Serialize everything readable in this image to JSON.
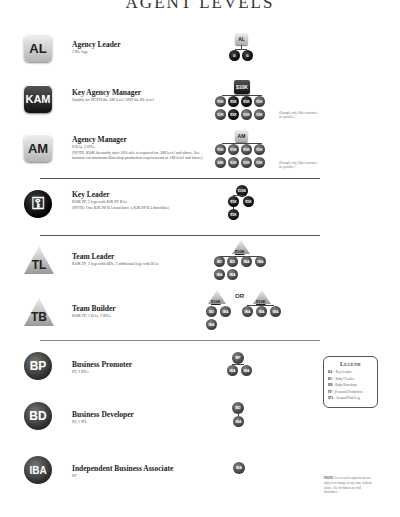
{
  "page_title": "AGENT LEVELS",
  "levels": [
    {
      "badge": "AL",
      "title": "Agency Leader",
      "desc": "2 KL legs"
    },
    {
      "badge": "KAM",
      "title": "Key Agency Manager",
      "desc": "Qualify for BOTH the AM level AND the KL level"
    },
    {
      "badge": "AM",
      "title": "Agency Manager",
      "desc": "8 BAs, 3 IPLs",
      "note": "(NOTE: $50K hierarchy after 50% rule is required for AM level and above. See footnote for minimum Baseshop production requirements at AM level and above)"
    },
    {
      "badge": "KL",
      "title": "Key Leader",
      "desc": "$10K PP, 2 legs with $5K PP BAs",
      "note": "(NOTE: One $5K PP BA must have a $5K PP BA downline)"
    },
    {
      "badge": "TL",
      "title": "Team Leader",
      "desc": "$10K PP, 2 legs with BDs, 2 additional legs with BAs"
    },
    {
      "badge": "TB",
      "title": "Team Builder",
      "desc": "$10K PP, 3 BAs, 2 IPLs"
    },
    {
      "badge": "BP",
      "title": "Business Promoter",
      "desc": "PP, 2 IPLs"
    },
    {
      "badge": "BD",
      "title": "Business Developer",
      "desc": "PP, 1 IPL"
    },
    {
      "badge": "IBA",
      "title": "Independent Business Associate",
      "desc": "PP"
    }
  ],
  "diagrams": {
    "al": {
      "top": "AL",
      "children": [
        "KL",
        "KL"
      ]
    },
    "kam": {
      "top": "$10K",
      "row1": [
        "$5K",
        "$5K",
        "$5K",
        "$5K"
      ],
      "row2": [
        "$2K",
        "$5K",
        "$2K",
        "$2K"
      ],
      "caption": "(Example only, Other structures are possible.)"
    },
    "am": {
      "top": "AM",
      "row1": [
        "$5K",
        "$5K",
        "$5K",
        "$5K"
      ],
      "row2": [
        "$4K",
        "$2K",
        "$2K",
        "$2K"
      ],
      "caption": "(Example only, Other structures are possible.)"
    },
    "kl": {
      "top": "$10K",
      "children": [
        "$5K",
        "$5K"
      ],
      "grandchild": "$5K"
    },
    "tl": {
      "top": "$10K",
      "row1": [
        "BD",
        "BD",
        "IBA",
        "IBA"
      ],
      "row2": [
        "IBA",
        "IBA"
      ]
    },
    "tb": {
      "left_top": "$10K",
      "left_children": [
        "BD",
        "IBA"
      ],
      "left_grandchild": "IBA",
      "or": "OR",
      "right_top": "$10K",
      "right_children": [
        "IBA",
        "IBA",
        "IBA"
      ]
    },
    "bp": {
      "top": "BP",
      "children": [
        "IBA",
        "IBA"
      ]
    },
    "bd": {
      "top": "BD",
      "child": "IBA"
    },
    "iba": {
      "top": "IBA"
    }
  },
  "legend": {
    "title": "Legend",
    "items": [
      {
        "abbr": "KL",
        "text": "- Key Leader"
      },
      {
        "abbr": "BC",
        "text": "- Baby Clocker"
      },
      {
        "abbr": "BB",
        "text": "- Baby Baseshop"
      },
      {
        "abbr": "PP",
        "text": "- Personal Production"
      },
      {
        "abbr": "IPL",
        "text": "- Insured Paid Leg"
      }
    ]
  },
  "footnote": {
    "label": "NOTE:",
    "text": "Levels and requirements are subject to change at any time without notice. See Invitation for full disclaimer."
  }
}
